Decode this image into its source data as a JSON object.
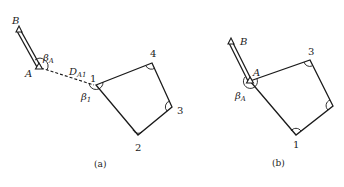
{
  "figure_a": {
    "caption": "(a)",
    "points": {
      "B": {
        "label": "B",
        "x": 19,
        "y": 30
      },
      "A": {
        "label": "A",
        "x": 39,
        "y": 67
      },
      "P1": {
        "label": "1",
        "x": 96,
        "y": 85
      },
      "P2": {
        "label": "2",
        "x": 138,
        "y": 135
      },
      "P3": {
        "label": "3",
        "x": 172,
        "y": 107
      },
      "P4": {
        "label": "4",
        "x": 152,
        "y": 63
      }
    },
    "angle_labels": {
      "beta_A": {
        "base": "β",
        "sub": "A"
      },
      "beta_1": {
        "base": "β",
        "sub": "1"
      }
    },
    "distance_label": {
      "base": "D",
      "sub": "A1"
    },
    "edges": [
      [
        "B",
        "A"
      ],
      [
        "A",
        "P1",
        "dashed"
      ],
      [
        "P1",
        "P4"
      ],
      [
        "P4",
        "P3"
      ],
      [
        "P3",
        "P2"
      ],
      [
        "P2",
        "P1"
      ]
    ]
  },
  "figure_b": {
    "caption": "(b)",
    "points": {
      "B": {
        "label": "B",
        "x": 231,
        "y": 42
      },
      "A": {
        "label": "A",
        "x": 250,
        "y": 81
      },
      "P3": {
        "label": "3",
        "x": 310,
        "y": 60
      },
      "P2": {
        "label": "",
        "x": 333,
        "y": 106
      },
      "P1": {
        "label": "1",
        "x": 296,
        "y": 135
      }
    },
    "angle_labels": {
      "beta_A": {
        "base": "β",
        "sub": "A"
      }
    },
    "edges": [
      [
        "B",
        "A"
      ],
      [
        "A",
        "P3"
      ],
      [
        "P3",
        "P2"
      ],
      [
        "P2",
        "P1"
      ],
      [
        "P1",
        "A"
      ]
    ]
  }
}
